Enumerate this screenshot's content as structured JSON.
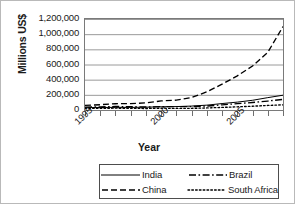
{
  "chart_data": {
    "type": "line",
    "title": "",
    "xlabel": "Year",
    "ylabel": "Millions US$",
    "xlim": [
      1995,
      2008
    ],
    "ylim": [
      0,
      1200000
    ],
    "grid": true,
    "legend_position": "bottom",
    "x": [
      1995,
      1996,
      1997,
      1998,
      1999,
      2000,
      2001,
      2002,
      2003,
      2004,
      2005,
      2006,
      2007,
      2008
    ],
    "xtick_labels": [
      "1995",
      "2000",
      "2005"
    ],
    "xtick_label_values": [
      1995,
      2000,
      2005
    ],
    "ytick_labels": [
      "0",
      "200,000",
      "400,000",
      "600,000",
      "800,000",
      "1,000,000",
      "1,200,000"
    ],
    "ytick_values": [
      0,
      200000,
      400000,
      600000,
      800000,
      1000000,
      1200000
    ],
    "series": [
      {
        "name": "India",
        "style": "solid",
        "values": [
          31000,
          33000,
          35000,
          34000,
          37000,
          43000,
          45000,
          52000,
          64000,
          85000,
          104000,
          128000,
          163000,
          195000
        ]
      },
      {
        "name": "China",
        "style": "dashed",
        "values": [
          60000,
          70000,
          83000,
          84000,
          94000,
          120000,
          130000,
          165000,
          240000,
          340000,
          450000,
          580000,
          760000,
          1100000
        ]
      },
      {
        "name": "Brazil",
        "style": "dash-dot",
        "values": [
          38000,
          42000,
          46000,
          44000,
          39000,
          44000,
          44000,
          45000,
          52000,
          68000,
          84000,
          99000,
          118000,
          140000
        ]
      },
      {
        "name": "South Africa",
        "style": "dotted",
        "values": [
          22000,
          23000,
          24000,
          22000,
          20000,
          23000,
          21000,
          22000,
          27000,
          34000,
          42000,
          50000,
          60000,
          68000
        ]
      }
    ]
  },
  "axis": {
    "y_title": "Millions US$",
    "x_title": "Year"
  },
  "legend": {
    "entries": [
      {
        "label": "India",
        "style": "solid"
      },
      {
        "label": "Brazil",
        "style": "dash-dot"
      },
      {
        "label": "China",
        "style": "dashed"
      },
      {
        "label": "South Africa",
        "style": "dotted"
      }
    ]
  },
  "colors": {
    "line": "#000000",
    "grid": "#9a9a9a",
    "axis": "#6f6f6f",
    "frame": "#b9b9b9",
    "background": "#ffffff"
  }
}
